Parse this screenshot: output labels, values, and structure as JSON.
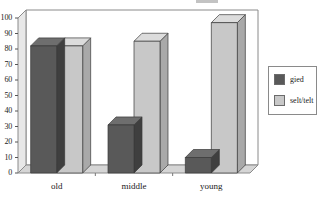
{
  "chart_data": {
    "type": "bar",
    "title": "",
    "xlabel": "",
    "ylabel": "",
    "categories": [
      "old",
      "middle",
      "young"
    ],
    "series": [
      {
        "name": "gied",
        "color": "#595959",
        "values": [
          82,
          31,
          10
        ]
      },
      {
        "name": "selt/telt",
        "color": "#c8c8c8",
        "values": [
          82,
          85,
          97
        ]
      }
    ],
    "ylim": [
      0,
      100
    ],
    "ytick_values": [
      0,
      10,
      20,
      30,
      40,
      50,
      60,
      70,
      80,
      90,
      100
    ],
    "ytick_labels": [
      "0",
      "10",
      "20",
      "30",
      "40",
      "50",
      "60",
      "70",
      "80",
      "90",
      "100"
    ],
    "grid": false,
    "three_d": true,
    "legend_position": "right",
    "legend_entries": [
      "gied",
      "selt/telt"
    ]
  },
  "axes": {
    "y_ticks": [
      "100",
      "90",
      "80",
      "70",
      "60",
      "50",
      "40",
      "30",
      "20",
      "10",
      "0"
    ],
    "x_labels": [
      "old",
      "middle",
      "young"
    ]
  },
  "legend": {
    "items": [
      {
        "label": "gied",
        "color": "#595959"
      },
      {
        "label": "selt/telt",
        "color": "#c8c8c8"
      }
    ]
  },
  "colors": {
    "bar_dark_front": "#595959",
    "bar_dark_top": "#6e6e6e",
    "bar_dark_side": "#3f3f3f",
    "bar_light_front": "#c8c8c8",
    "bar_light_top": "#dcdcdc",
    "bar_light_side": "#a9a9a9",
    "floor": "#d5d5d5",
    "wall": "#ffffff",
    "frame": "#808080",
    "text": "#1a1a1a"
  }
}
